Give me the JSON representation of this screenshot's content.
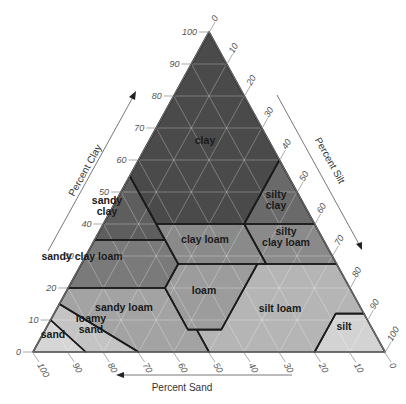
{
  "diagram": {
    "axes": {
      "clay": {
        "title": "Percent Clay",
        "ticks": [
          "0",
          "10",
          "20",
          "30",
          "40",
          "50",
          "60",
          "70",
          "80",
          "90",
          "100"
        ]
      },
      "silt": {
        "title": "Percent Silt",
        "ticks": [
          "0",
          "10",
          "20",
          "30",
          "40",
          "50",
          "60",
          "70",
          "80",
          "90",
          "100"
        ]
      },
      "sand": {
        "title": "Percent Sand",
        "ticks": [
          "100",
          "90",
          "80",
          "70",
          "60",
          "50",
          "40",
          "30",
          "20",
          "10",
          "0"
        ]
      }
    },
    "regions": [
      {
        "id": "clay",
        "label_lines": [
          "clay"
        ],
        "color": "#4a4a4a"
      },
      {
        "id": "sandy-clay",
        "label_lines": [
          "sandy",
          "clay"
        ],
        "color": "#5e5e5e"
      },
      {
        "id": "silty-clay",
        "label_lines": [
          "silty",
          "clay"
        ],
        "color": "#6a6a6a"
      },
      {
        "id": "sandy-clay-loam",
        "label_lines": [
          "sandy clay loam"
        ],
        "color": "#7a7a7a"
      },
      {
        "id": "clay-loam",
        "label_lines": [
          "clay loam"
        ],
        "color": "#8a8a8a"
      },
      {
        "id": "silty-clay-loam",
        "label_lines": [
          "silty",
          "clay loam"
        ],
        "color": "#8a8a8a"
      },
      {
        "id": "sandy-loam",
        "label_lines": [
          "sandy loam"
        ],
        "color": "#a3a3a3"
      },
      {
        "id": "loam",
        "label_lines": [
          "loam"
        ],
        "color": "#9c9c9c"
      },
      {
        "id": "silt-loam",
        "label_lines": [
          "silt loam"
        ],
        "color": "#b5b5b5"
      },
      {
        "id": "loamy-sand",
        "label_lines": [
          "loamy",
          "sand"
        ],
        "color": "#c4c4c4"
      },
      {
        "id": "sand",
        "label_lines": [
          "sand"
        ],
        "color": "#d6d6d6"
      },
      {
        "id": "silt",
        "label_lines": [
          "silt"
        ],
        "color": "#d3d3d3"
      }
    ]
  }
}
